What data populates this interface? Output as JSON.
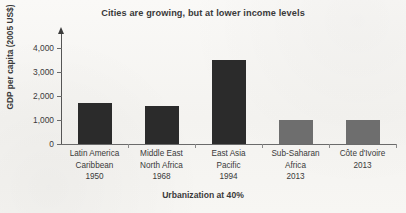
{
  "figure": {
    "background_color": "#f7f6f3"
  },
  "chart_data": {
    "type": "bar",
    "title": "Cities are growing, but at lower income levels",
    "xlabel": "Urbanization at 40%",
    "ylabel": "GDP per capita (2005 US$)",
    "categories": [
      "Latin America Caribbean 1950",
      "Middle East North Africa 1968",
      "East Asia Pacific 1994",
      "Sub-Saharan Africa 2013",
      "Côte d'Ivoire 2013"
    ],
    "category_lines": [
      [
        "Latin America",
        "Caribbean",
        "1950"
      ],
      [
        "Middle East",
        "North Africa",
        "1968"
      ],
      [
        "East Asia",
        "Pacific",
        "1994"
      ],
      [
        "Sub-Saharan",
        "Africa",
        "2013"
      ],
      [
        "Côte d'Ivoire",
        "2013"
      ]
    ],
    "values": [
      1700,
      1600,
      3500,
      1000,
      980
    ],
    "bar_colors": [
      "#2b2b2b",
      "#2b2b2b",
      "#2b2b2b",
      "#6e6e6e",
      "#6e6e6e"
    ],
    "ylim": [
      0,
      4500
    ],
    "ytick_values": [
      0,
      1000,
      2000,
      3000,
      4000
    ],
    "ytick_labels": [
      "0",
      "1,000",
      "2,000",
      "3,000",
      "4,000"
    ],
    "grid": false,
    "legend": null
  },
  "axis": {
    "y_arrow": "up-arrow-icon",
    "line_color": "#6a6a6a"
  }
}
